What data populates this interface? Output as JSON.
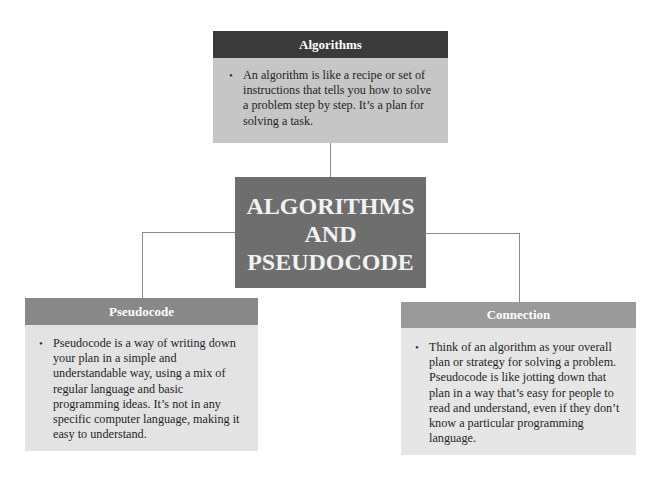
{
  "diagram": {
    "central": {
      "line1": "ALGORITHMS",
      "line2": "AND",
      "line3": "PSEUDOCODE"
    },
    "nodes": [
      {
        "title": "Algorithms",
        "bullet": "An algorithm is like a recipe or set of instructions that tells you how to solve a problem step by step. It’s a plan for solving a task."
      },
      {
        "title": "Pseudocode",
        "bullet": "Pseudocode is a way of writing down your plan in a simple and understandable way, using a mix of regular language and basic programming ideas. It’s not in any specific computer language, making it easy to understand."
      },
      {
        "title": "Connection",
        "bullet": "Think of an algorithm as your overall plan or strategy for solving a problem. Pseudocode is like jotting down that plan in a way that’s easy for people to read and understand, even if they don’t know a particular programming language."
      }
    ],
    "colors": {
      "algorithms_header": "#3a3a3a",
      "algorithms_body": "#c6c6c6",
      "central": "#6e6e6e",
      "pseudocode_header": "#888888",
      "connection_header": "#9a9a9a",
      "leaf_body": "#e4e4e4",
      "connector": "#8a8a8a"
    }
  }
}
